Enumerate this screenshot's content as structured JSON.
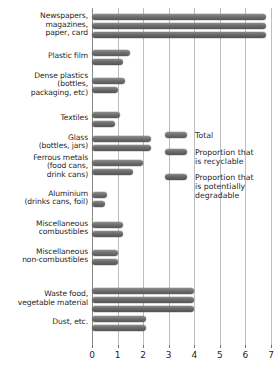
{
  "chart_data": {
    "type": "bar",
    "orientation": "horizontal",
    "title": "",
    "xlabel": "",
    "ylabel": "",
    "xlim": [
      0,
      7
    ],
    "xticks": [
      0,
      1,
      2,
      3,
      4,
      5,
      6,
      7
    ],
    "xtick_labels": [
      "0",
      "1",
      "2",
      "3",
      "4",
      "5",
      "6",
      "7"
    ],
    "grid": true,
    "grid_axis": "x",
    "legend_position": "inside-right",
    "categories": [
      "Newspapers,\nmagazines,\npaper, card",
      "Plastic film",
      "Dense plastics\n(bottles,\npackaging, etc)",
      "Textiles",
      "Glass\n(bottles, jars)",
      "Ferrous metals\n(food cans,\ndrink cans)",
      "Aluminium\n(drinks cans, foil)",
      "Miscellaneous\ncombustibles",
      "Miscellaneous\nnon-combustibles",
      "Waste food,\nvegetable material",
      "Dust, etc."
    ],
    "series": [
      {
        "name": "Total",
        "values": [
          6.8,
          1.5,
          1.3,
          1.1,
          2.3,
          2.0,
          0.6,
          1.2,
          1.0,
          4.0,
          2.1
        ]
      },
      {
        "name": "Proportion that is recyclable",
        "values": [
          6.8,
          1.2,
          1.0,
          0.9,
          2.3,
          1.6,
          0.5,
          1.2,
          1.0,
          4.0,
          2.1
        ]
      },
      {
        "name": "Proportion that is potentially degradable",
        "values": [
          6.8,
          0.0,
          0.0,
          0.0,
          0.0,
          0.0,
          0.0,
          0.0,
          0.0,
          4.0,
          0.0
        ]
      }
    ],
    "legend": [
      {
        "label": "Total",
        "series_key": "s-total"
      },
      {
        "label": "Proportion that\nis recyclable",
        "series_key": "s-recyclable"
      },
      {
        "label": "Proportion that\nis potentially\ndegradable",
        "series_key": "s-degradable"
      }
    ]
  }
}
